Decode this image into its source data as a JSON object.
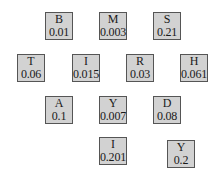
{
  "diagram": {
    "nodes": [
      {
        "label": "B",
        "value": "0.01",
        "x": 45,
        "y": 12
      },
      {
        "label": "M",
        "value": "0.003",
        "x": 99,
        "y": 12
      },
      {
        "label": "S",
        "value": "0.21",
        "x": 153,
        "y": 12
      },
      {
        "label": "T",
        "value": "0.06",
        "x": 17,
        "y": 54
      },
      {
        "label": "I",
        "value": "0.015",
        "x": 72,
        "y": 54
      },
      {
        "label": "R",
        "value": "0.03",
        "x": 126,
        "y": 54
      },
      {
        "label": "H",
        "value": "0.061",
        "x": 180,
        "y": 54
      },
      {
        "label": "A",
        "value": "0.1",
        "x": 45,
        "y": 96
      },
      {
        "label": "Y",
        "value": "0.007",
        "x": 99,
        "y": 96
      },
      {
        "label": "D",
        "value": "0.08",
        "x": 153,
        "y": 96
      },
      {
        "label": "I",
        "value": "0.201",
        "x": 99,
        "y": 137
      },
      {
        "label": "Y",
        "value": "0.2",
        "x": 167,
        "y": 140
      }
    ]
  }
}
